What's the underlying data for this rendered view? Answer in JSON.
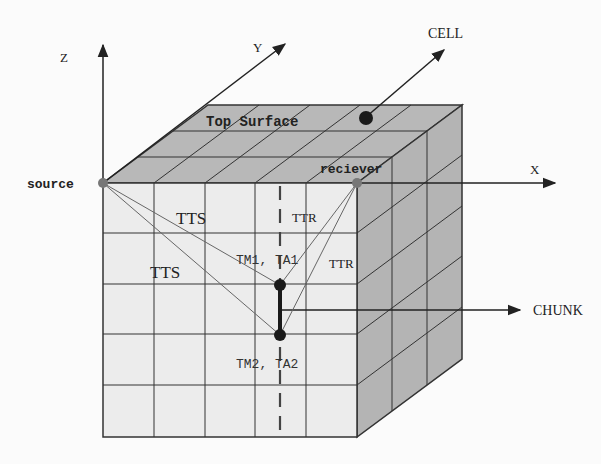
{
  "diagram": {
    "axes": {
      "z_label": "Z",
      "y_label": "Y",
      "x_label": "X"
    },
    "labels": {
      "cell": "CELL",
      "chunk": "CHUNK",
      "top_surface": "Top Surface",
      "source": "source",
      "receiver": "reciever",
      "tts_upper": "TTS",
      "tts_lower": "TTS",
      "ttr_upper": "TTR",
      "ttr_right": "TTR",
      "tm1_ta1": "TM1, TA1",
      "tm2_ta2": "TM2, TA2"
    },
    "grid": {
      "columns": 5,
      "rows": 5,
      "depth_layers": 3
    },
    "colors": {
      "front_face": "#ececec",
      "top_face": "#b8b8b8",
      "side_face": "#b4b4b4",
      "lines": "#333333",
      "point_source": "#777777",
      "point_dark": "#1a1a1a"
    }
  }
}
